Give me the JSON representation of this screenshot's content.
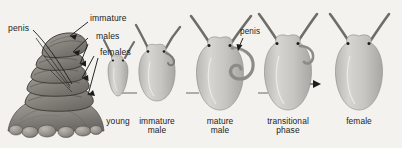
{
  "figure": {
    "background_color": "#f4f2ee",
    "ink_color": "#1c1c1c",
    "body_fill": "#c9c8c4",
    "body_shade": "#a9a8a4",
    "rock_fill": "#8f8d88"
  },
  "callouts": [
    {
      "id": "penis-stack",
      "label": "penis"
    },
    {
      "id": "immature",
      "label": "immature"
    },
    {
      "id": "males",
      "label": "males"
    },
    {
      "id": "females",
      "label": "females"
    },
    {
      "id": "penis-mature",
      "label": "penis"
    }
  ],
  "stages": [
    {
      "id": "young",
      "line1": "young",
      "line2": ""
    },
    {
      "id": "immature-male",
      "line1": "immature",
      "line2": "male"
    },
    {
      "id": "mature-male",
      "line1": "mature",
      "line2": "male"
    },
    {
      "id": "transitional-phase",
      "line1": "transitional",
      "line2": "phase"
    },
    {
      "id": "female",
      "line1": "female",
      "line2": ""
    }
  ]
}
